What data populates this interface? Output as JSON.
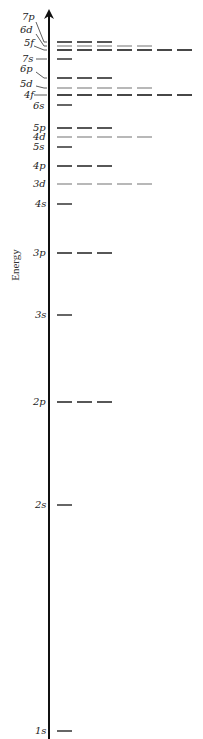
{
  "diagram": {
    "axis": {
      "label": "Energy",
      "x": 49,
      "top_y": 9,
      "bottom_y": 739,
      "color": "#111111"
    },
    "dash": {
      "start_x": 57,
      "width": 15,
      "period": 20
    },
    "colors": {
      "s": "#555555",
      "p": "#444444",
      "d": "#9a9a9a",
      "f": "#333333"
    },
    "levels": [
      {
        "label": "7p",
        "type": "p",
        "count": 3,
        "y": 42,
        "label_x": 22,
        "label_y": 20,
        "leader": [
          36,
          22,
          47,
          42
        ]
      },
      {
        "label": "6d",
        "type": "d",
        "count": 5,
        "y": 46,
        "label_x": 20,
        "label_y": 33,
        "leader": [
          36,
          34,
          47,
          46
        ]
      },
      {
        "label": "5f",
        "type": "f",
        "count": 7,
        "y": 50,
        "label_x": 24,
        "label_y": 46,
        "leader": [
          34,
          46,
          47,
          50
        ]
      },
      {
        "label": "7s",
        "type": "s",
        "count": 1,
        "y": 59,
        "label_x": 22,
        "label_y": 62,
        "leader": [
          36,
          59,
          47,
          59
        ]
      },
      {
        "label": "6p",
        "type": "p",
        "count": 3,
        "y": 78,
        "label_x": 20,
        "label_y": 72,
        "leader": [
          36,
          72,
          47,
          78
        ]
      },
      {
        "label": "5d",
        "type": "d",
        "count": 5,
        "y": 88,
        "label_x": 20,
        "label_y": 87,
        "leader": [
          36,
          86,
          47,
          88
        ]
      },
      {
        "label": "4f",
        "type": "f",
        "count": 7,
        "y": 95,
        "label_x": 24,
        "label_y": 98,
        "leader": [
          34,
          95,
          47,
          95
        ]
      },
      {
        "label": "6s",
        "type": "s",
        "count": 1,
        "y": 105,
        "label_x": 33,
        "label_y": 109,
        "leader": null
      },
      {
        "label": "5p",
        "type": "p",
        "count": 3,
        "y": 128,
        "label_x": 33,
        "label_y": 131,
        "leader": null
      },
      {
        "label": "4d",
        "type": "d",
        "count": 5,
        "y": 137,
        "label_x": 33,
        "label_y": 140,
        "leader": null
      },
      {
        "label": "5s",
        "type": "s",
        "count": 1,
        "y": 147,
        "label_x": 33,
        "label_y": 150,
        "leader": null
      },
      {
        "label": "4p",
        "type": "p",
        "count": 3,
        "y": 166,
        "label_x": 33,
        "label_y": 169,
        "leader": null
      },
      {
        "label": "3d",
        "type": "d",
        "count": 5,
        "y": 184,
        "label_x": 33,
        "label_y": 187,
        "leader": null
      },
      {
        "label": "4s",
        "type": "s",
        "count": 1,
        "y": 204,
        "label_x": 35,
        "label_y": 207,
        "leader": null
      },
      {
        "label": "3p",
        "type": "p",
        "count": 3,
        "y": 253,
        "label_x": 33,
        "label_y": 256,
        "leader": null
      },
      {
        "label": "3s",
        "type": "s",
        "count": 1,
        "y": 315,
        "label_x": 35,
        "label_y": 318,
        "leader": null
      },
      {
        "label": "2p",
        "type": "p",
        "count": 3,
        "y": 402,
        "label_x": 33,
        "label_y": 405,
        "leader": null
      },
      {
        "label": "2s",
        "type": "s",
        "count": 1,
        "y": 505,
        "label_x": 35,
        "label_y": 508,
        "leader": null
      },
      {
        "label": "1s",
        "type": "s",
        "count": 1,
        "y": 731,
        "label_x": 35,
        "label_y": 734,
        "leader": null
      }
    ]
  }
}
